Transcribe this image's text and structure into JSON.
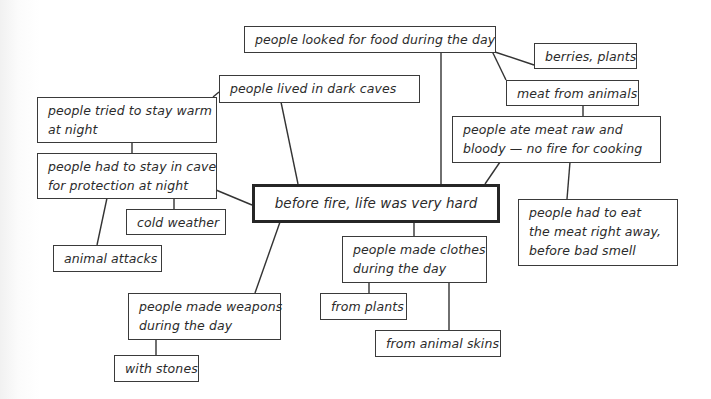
{
  "diagram": {
    "type": "concept-map",
    "colors": {
      "background": "#ffffff",
      "border": "#3a3a3a",
      "text": "#2b2b2b",
      "line": "#333333"
    },
    "central": {
      "id": "central",
      "lines": [
        "before fire, life was very hard"
      ]
    },
    "nodes": [
      {
        "id": "food",
        "lines": [
          "people looked for food during the day"
        ]
      },
      {
        "id": "berries",
        "lines": [
          "berries, plants"
        ]
      },
      {
        "id": "meat",
        "lines": [
          "meat from animals"
        ]
      },
      {
        "id": "raw",
        "lines": [
          "people ate meat raw and",
          "bloody — no fire for cooking"
        ]
      },
      {
        "id": "eat-away",
        "lines": [
          "people had to eat",
          "the meat right away,",
          "before bad smell"
        ]
      },
      {
        "id": "caves",
        "lines": [
          "people lived in dark caves"
        ]
      },
      {
        "id": "warm",
        "lines": [
          "people tried to stay warm",
          "at night"
        ]
      },
      {
        "id": "protection",
        "lines": [
          "people had to stay in cave",
          "for protection at night"
        ]
      },
      {
        "id": "cold",
        "lines": [
          "cold weather"
        ]
      },
      {
        "id": "attacks",
        "lines": [
          "animal attacks"
        ]
      },
      {
        "id": "clothes",
        "lines": [
          "people made clothes",
          "during the day"
        ]
      },
      {
        "id": "plants",
        "lines": [
          "from plants"
        ]
      },
      {
        "id": "skins",
        "lines": [
          "from animal skins"
        ]
      },
      {
        "id": "weapons",
        "lines": [
          "people made weapons",
          "during the day"
        ]
      },
      {
        "id": "stones",
        "lines": [
          "with stones"
        ]
      }
    ],
    "edges": [
      [
        "central",
        "food"
      ],
      [
        "central",
        "caves"
      ],
      [
        "central",
        "protection"
      ],
      [
        "central",
        "raw"
      ],
      [
        "central",
        "clothes"
      ],
      [
        "central",
        "weapons"
      ],
      [
        "food",
        "berries"
      ],
      [
        "food",
        "meat"
      ],
      [
        "meat",
        "raw"
      ],
      [
        "raw",
        "eat-away"
      ],
      [
        "caves",
        "warm"
      ],
      [
        "warm",
        "protection"
      ],
      [
        "protection",
        "cold"
      ],
      [
        "protection",
        "attacks"
      ],
      [
        "clothes",
        "plants"
      ],
      [
        "clothes",
        "skins"
      ],
      [
        "weapons",
        "stones"
      ]
    ]
  }
}
